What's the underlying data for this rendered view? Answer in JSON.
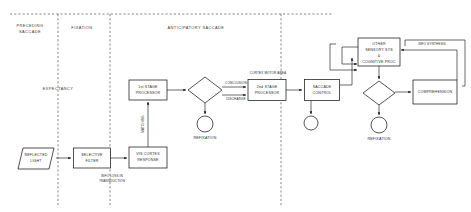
{
  "diagram": {
    "phases": [
      {
        "id": "preceding-saccade",
        "label_line1": "PRECEDING",
        "label_line2": "SACCADE",
        "x": 30,
        "y": 28
      },
      {
        "id": "fixation",
        "label_line1": "FIXATION",
        "label_line2": "",
        "x": 82,
        "y": 28
      },
      {
        "id": "anticipatory-saccade",
        "label_line1": "ANTICIPATORY SACCADE",
        "label_line2": "",
        "x": 196,
        "y": 28
      },
      {
        "id": "expectancy",
        "label_line1": "EXPECTANCY",
        "label_line2": "",
        "x": 58,
        "y": 89
      }
    ],
    "nodes": [
      {
        "id": "reflected-light",
        "shape": "parallelogram",
        "label_line1": "REFLECTED",
        "label_line2": "LIGHT",
        "cx": 36,
        "cy": 158,
        "w": 36,
        "h": 21
      },
      {
        "id": "selective-filter",
        "shape": "rect",
        "label_line1": "SELECTIVE",
        "label_line2": "FILTER",
        "cx": 92,
        "cy": 158,
        "w": 37,
        "h": 20
      },
      {
        "id": "vis-cortex-response",
        "shape": "rect",
        "label_line1": "VIS CORTEX",
        "label_line2": "RESPONSE",
        "cx": 148,
        "cy": 158,
        "w": 38,
        "h": 21
      },
      {
        "id": "first-stage-processor",
        "shape": "rect",
        "label_line1": "1st STAGE",
        "label_line2": "PROCESSOR",
        "cx": 148,
        "cy": 90,
        "w": 38,
        "h": 20
      },
      {
        "id": "decision-1",
        "shape": "diamond",
        "label_line1": "",
        "label_line2": "",
        "cx": 205,
        "cy": 90,
        "w": 34,
        "h": 26
      },
      {
        "id": "refixation-1",
        "shape": "circle",
        "label_line1": "REFIXATION",
        "label_line2": "",
        "cx": 205,
        "cy": 124,
        "r": 8
      },
      {
        "id": "second-stage-processor",
        "shape": "rect",
        "label_line1": "2nd STAGE",
        "label_line2": "PROCESSOR",
        "cx": 267,
        "cy": 90,
        "w": 38,
        "h": 21
      },
      {
        "id": "saccade-control",
        "shape": "rect",
        "label_line1": "SACCADE",
        "label_line2": "CONTROL",
        "cx": 322,
        "cy": 90,
        "w": 35,
        "h": 21
      },
      {
        "id": "refixation-mid",
        "shape": "circle",
        "label_line1": "",
        "label_line2": "",
        "cx": 311,
        "cy": 123,
        "r": 7
      },
      {
        "id": "other-sensory-cognitive",
        "shape": "rect",
        "label_line1": "OTHER",
        "label_line2": "SENSORY SYS",
        "label_line3": "&",
        "label_line4": "COGNITIVE PROC",
        "cx": 379,
        "cy": 52,
        "w": 42,
        "h": 28
      },
      {
        "id": "decision-2",
        "shape": "diamond",
        "label_line1": "",
        "label_line2": "",
        "cx": 379,
        "cy": 93,
        "w": 32,
        "h": 24
      },
      {
        "id": "refixation-2",
        "shape": "circle",
        "label_line1": "REFIXATION",
        "label_line2": "",
        "cx": 379,
        "cy": 125,
        "r": 8
      },
      {
        "id": "comprehension",
        "shape": "rect",
        "label_line1": "COMPREHENSION",
        "label_line2": "",
        "cx": 435,
        "cy": 92,
        "w": 44,
        "h": 24
      }
    ],
    "edge_labels": [
      {
        "id": "info-loss-transduction",
        "line1": "INFO LOSS IN",
        "line2": "TRANSDUCTION",
        "x": 112,
        "y": 176
      },
      {
        "id": "matching",
        "line1": "MATCHING",
        "line2": "",
        "x": 143,
        "y": 124
      },
      {
        "id": "conclusion",
        "line1": "CONCLUSION",
        "line2": "",
        "x": 237,
        "y": 83
      },
      {
        "id": "discharge",
        "line1": "DISCHARGE",
        "line2": "",
        "x": 237,
        "y": 94
      },
      {
        "id": "cortex-motor-area",
        "line1": "CORTEX MOTOR AREA",
        "line2": "",
        "x": 268,
        "y": 73
      },
      {
        "id": "info-synthesis",
        "line1": "INFO SYNTHESIS",
        "line2": "",
        "x": 432,
        "y": 44
      }
    ]
  },
  "colors": {
    "stroke": "#1a1a1a",
    "text": "#2b2b2b",
    "dashed": "#555555",
    "background": "#ffffff"
  }
}
